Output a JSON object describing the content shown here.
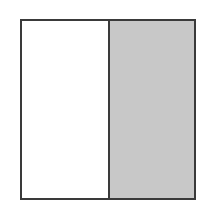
{
  "diagram": {
    "shape": "square",
    "parts": [
      {
        "label": "",
        "shaded": false,
        "fill": "#ffffff"
      },
      {
        "label": "",
        "shaded": true,
        "fill": "#c8c8c8"
      }
    ],
    "total_parts": 2,
    "shaded_parts": 1,
    "border_color": "#3a3a3a"
  }
}
